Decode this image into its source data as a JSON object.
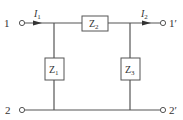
{
  "diagram": {
    "type": "two-port T-network",
    "terminals": {
      "t1": "1",
      "t1p": "1′",
      "t2": "2",
      "t2p": "2′"
    },
    "currents": {
      "i1": {
        "main": "I",
        "sub": "1"
      },
      "i2": {
        "main": "I",
        "sub": "2"
      }
    },
    "impedances": {
      "z1": {
        "main": "Z",
        "sub": "1"
      },
      "z2": {
        "main": "Z",
        "sub": "2"
      },
      "z3": {
        "main": "Z",
        "sub": "3"
      }
    },
    "colors": {
      "wire": "#555555",
      "text": "#333333",
      "background": "#ffffff"
    }
  }
}
